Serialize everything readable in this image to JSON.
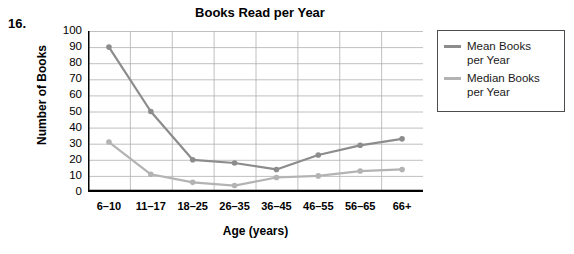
{
  "question_number": "16.",
  "chart_data": {
    "type": "line",
    "title": "Books Read per Year",
    "xlabel": "Age (years)",
    "ylabel": "Number of Books",
    "categories": [
      "6–10",
      "11–17",
      "18–25",
      "26–35",
      "36–45",
      "46–55",
      "56–65",
      "66+"
    ],
    "series": [
      {
        "name": "Mean Books per Year",
        "legend_line1": "Mean Books",
        "legend_line2": "per Year",
        "color": "#8c8c8c",
        "values": [
          90,
          50,
          20,
          18,
          14,
          23,
          29,
          33
        ]
      },
      {
        "name": "Median Books per Year",
        "legend_line1": "Median Books",
        "legend_line2": "per Year",
        "color": "#b3b3b3",
        "values": [
          31,
          11,
          6,
          4,
          9,
          10,
          13,
          14
        ]
      }
    ],
    "ylim": [
      0,
      100
    ],
    "ytick_step": 10,
    "yticks": [
      "100",
      "90",
      "80",
      "70",
      "60",
      "50",
      "40",
      "30",
      "20",
      "10",
      "0"
    ],
    "grid": true,
    "legend_position": "right-outside",
    "axis_color": "#000000",
    "grid_color": "#b0b0b0"
  }
}
